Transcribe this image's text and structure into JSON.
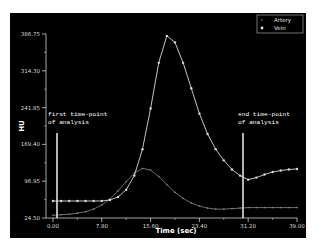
{
  "chart_data": {
    "type": "line",
    "title": "",
    "xlabel": "Time (sec)",
    "ylabel": "HU",
    "xlim": [
      0,
      39
    ],
    "ylim": [
      24.5,
      386.75
    ],
    "x_ticks": [
      "0.00",
      "7.80",
      "15.60",
      "23.40",
      "31.20",
      "39.00"
    ],
    "y_ticks": [
      "24.50",
      "96.95",
      "169.40",
      "241.85",
      "314.30",
      "386.75"
    ],
    "grid": false,
    "legend_position": "top-right",
    "x": [
      0,
      1.3,
      2.6,
      3.9,
      5.2,
      6.5,
      7.8,
      9.1,
      10.4,
      11.7,
      13.0,
      14.3,
      15.6,
      16.9,
      18.2,
      19.5,
      20.8,
      22.1,
      23.4,
      24.7,
      26.0,
      27.3,
      28.6,
      29.9,
      31.2,
      32.5,
      33.8,
      35.1,
      36.4,
      37.7,
      39.0
    ],
    "series": [
      {
        "name": "Artery",
        "color": "#8a8a8a",
        "values": [
          30,
          31,
          32,
          34,
          37,
          42,
          50,
          62,
          78,
          96,
          113,
          122,
          119,
          106,
          90,
          75,
          63,
          54,
          48,
          44,
          42,
          42,
          43,
          44,
          45,
          45,
          45,
          45,
          45,
          45,
          45
        ]
      },
      {
        "name": "Vein",
        "color": "#d8d8d8",
        "values": [
          58,
          58,
          58,
          58,
          58,
          58,
          58,
          60,
          66,
          80,
          108,
          160,
          240,
          330,
          383,
          370,
          330,
          280,
          230,
          190,
          160,
          138,
          120,
          108,
          100,
          104,
          110,
          115,
          118,
          120,
          121
        ]
      }
    ],
    "annotations": [
      {
        "text": "first time-point of analysis",
        "x": 0.6
      },
      {
        "text": "end time-point of analysis",
        "x": 31.2
      }
    ]
  },
  "labels": {
    "ylabel": "HU",
    "xlabel": "Time (sec)",
    "first_line1": "first time-point",
    "first_line2": "of analysis",
    "end_line1": "end time-point",
    "end_line2": "of analysis",
    "legend_artery": "Artery",
    "legend_vein": "Vein",
    "xt0": "0.00",
    "xt1": "7.80",
    "xt2": "15.60",
    "xt3": "23.40",
    "xt4": "31.20",
    "xt5": "39.00",
    "yt0": "24.50",
    "yt1": "96.95",
    "yt2": "169.40",
    "yt3": "241.85",
    "yt4": "314.30",
    "yt5": "386.75"
  }
}
